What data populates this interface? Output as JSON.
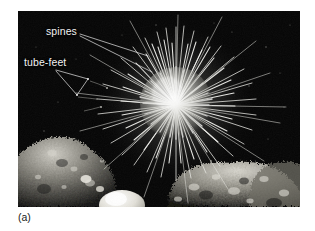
{
  "figure": {
    "caption": "(a)",
    "photo": {
      "background_color": "#000000",
      "page_background_color": "#ffffff",
      "frame": {
        "x": 18,
        "y": 11,
        "width": 282,
        "height": 196
      },
      "scene_description": "black and white underwater photograph of a sea urchin on rocky substrate",
      "organism": {
        "name": "sea urchin",
        "body_center": {
          "x": 176,
          "y": 105
        },
        "test_radius": 34,
        "spine_length": 46,
        "spine_count": 420,
        "spine_color": "#f4f4f2",
        "test_color": "#bfbfba"
      },
      "substrate": {
        "name": "rocks",
        "color_light": "#cfcdc6",
        "color_mid": "#7d7b74",
        "color_dark": "#2a2a28"
      }
    },
    "annotations": [
      {
        "id": "spines",
        "label": "spines",
        "label_x": 46,
        "label_y": 26,
        "leader_color": "#e8e8e8",
        "leaders": [
          {
            "x1": 80,
            "y1": 34,
            "x2": 148,
            "y2": 56
          },
          {
            "x1": 80,
            "y1": 36,
            "x2": 152,
            "y2": 72
          }
        ]
      },
      {
        "id": "tube-feet",
        "label": "tube-feet",
        "label_x": 24,
        "label_y": 57,
        "leader_color": "#e8e8e8",
        "leaders": [
          {
            "x1": 56,
            "y1": 70,
            "x2": 88,
            "y2": 79
          },
          {
            "x1": 56,
            "y1": 71,
            "x2": 77,
            "y2": 95
          },
          {
            "x1": 88,
            "y1": 79,
            "x2": 77,
            "y2": 95
          }
        ],
        "targets": [
          {
            "x": 89,
            "y": 79
          },
          {
            "x": 76,
            "y": 96
          }
        ]
      }
    ]
  }
}
